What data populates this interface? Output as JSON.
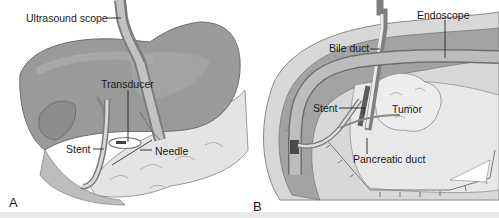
{
  "figure": {
    "panels": [
      {
        "id": "A",
        "letter": "A",
        "labels": {
          "ultrasound_scope": "Ultrasound scope",
          "transducer": "Transducer",
          "stent": "Stent",
          "needle": "Needle"
        }
      },
      {
        "id": "B",
        "letter": "B",
        "labels": {
          "endoscope": "Endoscope",
          "bile_duct": "Bile duct",
          "stent": "Stent",
          "tumor": "Tumor",
          "pancreatic_duct": "Pancreatic duct"
        }
      }
    ],
    "colors": {
      "organ_dark": "#8a8a8a",
      "organ_mid": "#a9a9a9",
      "organ_light": "#cfcfcf",
      "tissue_pale": "#e6e6e6",
      "outline": "#555555",
      "leader_line": "#222222",
      "background": "#ffffff"
    }
  }
}
